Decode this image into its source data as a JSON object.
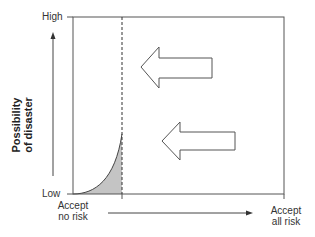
{
  "diagram": {
    "type": "risk acceptance diagram",
    "y_axis": {
      "title_line1": "Possibility",
      "title_line2": "of disaster",
      "high_label": "High",
      "low_label": "Low"
    },
    "x_axis": {
      "left_label_line1": "Accept",
      "left_label_line2": "no risk",
      "right_label_line1": "Accept",
      "right_label_line2": "all risk"
    },
    "elements": {
      "curve": "exponential rise from Low toward dashed boundary, shaded area beneath",
      "dashed_line": "vertical boundary line",
      "arrows": [
        "left-pointing hollow arrow (upper)",
        "left-pointing hollow arrow (lower)"
      ]
    },
    "colors": {
      "line": "#444444",
      "shade": "#c4c4c4",
      "background": "#ffffff"
    }
  }
}
